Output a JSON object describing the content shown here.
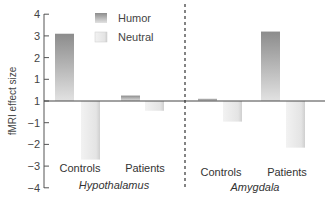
{
  "chart_data": {
    "type": "bar",
    "title": "",
    "xlabel": "",
    "ylabel": "fMRI effect size",
    "ylim": [
      -4,
      4
    ],
    "yticks": [
      4,
      3,
      2,
      1,
      0,
      -1,
      -2,
      -3,
      -4
    ],
    "ytick_labels": [
      "4",
      "3",
      "2",
      "1",
      "1",
      "−1",
      "−2",
      "−3",
      "−4"
    ],
    "grid": false,
    "legend_position": "top-left",
    "groups": [
      {
        "name": "Hypothalamus",
        "categories": [
          "Controls",
          "Patients"
        ]
      },
      {
        "name": "Amygdala",
        "categories": [
          "Controls",
          "Patients"
        ]
      }
    ],
    "categories": [
      "Hypothalamus Controls",
      "Hypothalamus Patients",
      "Amygdala Controls",
      "Amygdala Patients"
    ],
    "series": [
      {
        "name": "Humor",
        "color": "#9a9a9a",
        "values": [
          3.1,
          0.25,
          0.1,
          3.2
        ]
      },
      {
        "name": "Neutral",
        "color": "#e6e6e6",
        "values": [
          -2.7,
          -0.45,
          -0.95,
          -2.15
        ]
      }
    ]
  },
  "labels": {
    "ylabel": "fMRI effect size",
    "legend": [
      "Humor",
      "Neutral"
    ],
    "categories": [
      "Controls",
      "Patients",
      "Controls",
      "Patients"
    ],
    "groups": [
      "Hypothalamus",
      "Amygdala"
    ],
    "ticks": [
      "4",
      "3",
      "2",
      "1",
      "1",
      "−1",
      "−2",
      "−3",
      "−4"
    ]
  }
}
